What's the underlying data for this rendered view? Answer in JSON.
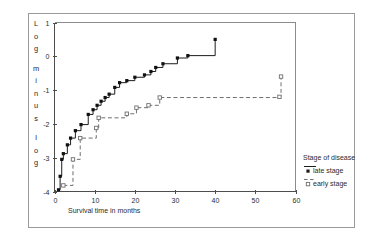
{
  "chart_data": {
    "type": "line",
    "title": "",
    "xlabel": "Survival time in months",
    "ylabel": "Log minus log",
    "xlim": [
      0,
      60
    ],
    "ylim": [
      -4,
      1
    ],
    "xticks": [
      0,
      10,
      20,
      30,
      40,
      50,
      60
    ],
    "xticklabels": [
      "0",
      "10",
      "20",
      "30",
      "40",
      "50",
      "60"
    ],
    "yticks": [
      1,
      0,
      -1,
      -2,
      -3,
      -4
    ],
    "yticklabels": [
      "1",
      "0",
      "-1",
      "-2",
      "-3",
      "-4"
    ],
    "grid": false,
    "legend_position": "right",
    "legend_title": "Stage of disease",
    "series": [
      {
        "name": "late stage",
        "style": "solid",
        "marker": "filled-square",
        "color": "#1c1c1c",
        "points": [
          [
            1.0,
            -3.95
          ],
          [
            1.4,
            -3.55
          ],
          [
            1.8,
            -3.05
          ],
          [
            2.2,
            -2.88
          ],
          [
            3.2,
            -2.62
          ],
          [
            4.0,
            -2.42
          ],
          [
            5.2,
            -2.2
          ],
          [
            6.6,
            -2.02
          ],
          [
            8.4,
            -1.72
          ],
          [
            9.6,
            -1.58
          ],
          [
            10.6,
            -1.45
          ],
          [
            11.6,
            -1.33
          ],
          [
            12.6,
            -1.22
          ],
          [
            13.6,
            -1.12
          ],
          [
            15.0,
            -0.92
          ],
          [
            16.2,
            -0.78
          ],
          [
            18.0,
            -0.72
          ],
          [
            20.0,
            -0.62
          ],
          [
            22.4,
            -0.55
          ],
          [
            24.0,
            -0.45
          ],
          [
            25.2,
            -0.33
          ],
          [
            27.0,
            -0.22
          ],
          [
            30.6,
            -0.05
          ],
          [
            33.2,
            0.02
          ],
          [
            40.0,
            0.5
          ]
        ]
      },
      {
        "name": "early stage",
        "style": "dashed",
        "marker": "open-square",
        "color": "#6f6f6f",
        "points": [
          [
            2.2,
            -3.82
          ],
          [
            4.6,
            -3.05
          ],
          [
            6.4,
            -2.42
          ],
          [
            10.4,
            -2.12
          ],
          [
            11.0,
            -1.82
          ],
          [
            18.0,
            -1.7
          ],
          [
            20.4,
            -1.52
          ],
          [
            23.4,
            -1.45
          ],
          [
            26.2,
            -1.22
          ],
          [
            56.0,
            -1.2
          ],
          [
            56.4,
            -0.6
          ]
        ]
      }
    ],
    "legend_entries": [
      {
        "label": "late stage",
        "style": "solid",
        "marker": "filled-square",
        "color": "#1c1c1c"
      },
      {
        "label": "early stage",
        "style": "dashed",
        "marker": "open-square",
        "color": "#6f6f6f"
      }
    ]
  },
  "colors": {
    "late_stage": "#1c1c1c",
    "early_stage": "#6f6f6f",
    "axis": "#4d4d4d",
    "frame": "#9a9a9a",
    "background": "#ffffff"
  }
}
